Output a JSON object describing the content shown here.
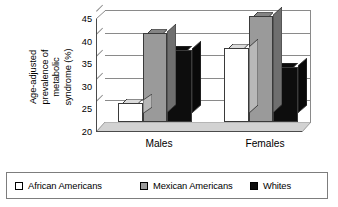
{
  "chart_data": {
    "type": "bar",
    "title": "",
    "subtitle": "",
    "xlabel": "",
    "ylabel": "Age-adjusted prevalence of metabolic syndrome (%)",
    "ylabel_lines": [
      "Age-adjusted",
      "prevalence of",
      "metabolic",
      "syndrome (%)"
    ],
    "categories": [
      "Males",
      "Females"
    ],
    "series": [
      {
        "name": "African Americans",
        "values": [
          24.3,
          36.4
        ],
        "color": "#ffffff"
      },
      {
        "name": "Mexican Americans",
        "values": [
          39.6,
          43.4
        ],
        "color": "#9a9a9a"
      },
      {
        "name": "Whites",
        "values": [
          35.9,
          32.1
        ],
        "color": "#0d0d0d"
      }
    ],
    "ylim": [
      20,
      45
    ],
    "yticks": [
      20,
      25,
      30,
      35,
      40,
      45
    ],
    "ytick_labels": [
      "20",
      "25",
      "30",
      "35",
      "40",
      "45"
    ],
    "grid": true,
    "grid_axis": "y",
    "legend_position": "bottom",
    "style": "3d-column",
    "bar_edge_color": "#3a3a3a",
    "grid_color": "#8a8a8a",
    "axis_color": "#4a4a4a",
    "floor_color": "#d2d2d2",
    "wall_color": "#ffffff"
  },
  "legend": {
    "entries": [
      {
        "label": "African Americans",
        "color": "#ffffff"
      },
      {
        "label": "Mexican Americans",
        "color": "#9a9a9a"
      },
      {
        "label": "Whites",
        "color": "#0d0d0d"
      }
    ]
  }
}
